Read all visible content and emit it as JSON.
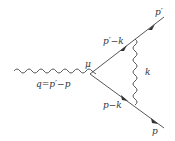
{
  "diagram": {
    "type": "feynman-diagram",
    "vertex_label": "μ",
    "external_photon": {
      "label": "q=p′−p"
    },
    "fermion_lines": [
      {
        "id": "upper-internal",
        "label": "p′−k"
      },
      {
        "id": "lower-internal",
        "label": "p−k"
      },
      {
        "id": "outgoing",
        "label": "p′"
      },
      {
        "id": "incoming",
        "label": "p"
      }
    ],
    "internal_photon": {
      "label": "k"
    },
    "colors": {
      "line": "#444444",
      "text": "#333333",
      "background": "#ffffff"
    }
  }
}
